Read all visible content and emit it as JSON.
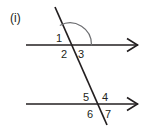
{
  "figure": {
    "part_label": "(i)",
    "background_color": "#ffffff",
    "stroke_color": "#231f20",
    "arc_color": "#6d6e71",
    "description_type": "parallel-lines-cut-by-transversal",
    "canvas": {
      "width": 147,
      "height": 127
    },
    "lines": [
      {
        "name": "upper-parallel-line",
        "x1": 26,
        "y1": 45,
        "x2": 138,
        "y2": 45,
        "arrow_right": true,
        "arrow_left": false
      },
      {
        "name": "lower-parallel-line",
        "x1": 26,
        "y1": 104,
        "x2": 138,
        "y2": 104,
        "arrow_right": true,
        "arrow_left": false
      },
      {
        "name": "transversal-line",
        "x1": 55,
        "y1": 7,
        "x2": 107,
        "y2": 125,
        "arrow_right": false,
        "arrow_left": false
      }
    ],
    "intersections": [
      {
        "name": "upper-intersection",
        "x": 70,
        "y": 45
      },
      {
        "name": "lower-intersection",
        "x": 97,
        "y": 104
      }
    ],
    "arc": {
      "name": "angle-arc-upper",
      "center_x": 70,
      "center_y": 45,
      "radius": 22,
      "start_x": 60.3,
      "start_y": 23.2,
      "end_x": 92,
      "end_y": 45,
      "sweep": "clockwise-from-transversal-to-right-ray"
    },
    "angle_labels": [
      {
        "id": "1",
        "text": "1",
        "x": 60,
        "y": 41,
        "position": "upper-left-of-upper-intersection"
      },
      {
        "id": "2",
        "text": "2",
        "x": 62,
        "y": 57,
        "position": "lower-left-of-upper-intersection"
      },
      {
        "id": "3",
        "text": "3",
        "x": 80,
        "y": 57,
        "position": "lower-right-of-upper-intersection"
      },
      {
        "id": "4",
        "text": "4",
        "x": 103,
        "y": 100,
        "position": "upper-right-of-lower-intersection"
      },
      {
        "id": "5",
        "text": "5",
        "x": 84,
        "y": 100,
        "position": "upper-left-of-lower-intersection"
      },
      {
        "id": "6",
        "text": "6",
        "x": 87,
        "y": 117,
        "position": "lower-left-of-lower-intersection"
      },
      {
        "id": "7",
        "text": "7",
        "x": 106,
        "y": 117,
        "position": "lower-right-of-lower-intersection"
      }
    ],
    "part_label_position": {
      "x": 10,
      "y": 22
    }
  }
}
